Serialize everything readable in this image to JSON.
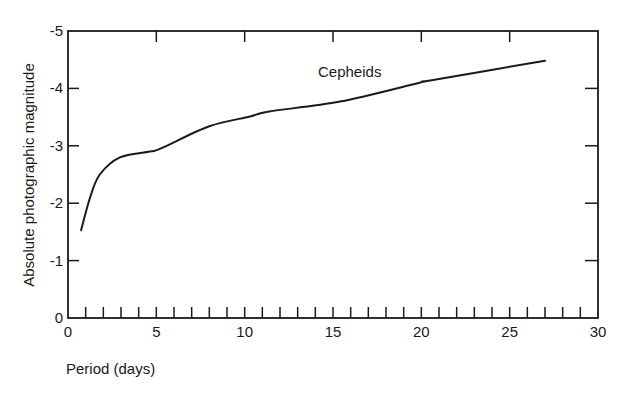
{
  "chart_data": {
    "type": "line",
    "title": "",
    "xlabel": "Period (days)",
    "ylabel": "Absolute photographic magnitude",
    "xlim": [
      0,
      30
    ],
    "ylim": [
      0,
      -5
    ],
    "y_inverted": true,
    "grid": false,
    "legend": null,
    "x_ticks": [
      0,
      5,
      10,
      15,
      20,
      25,
      30
    ],
    "x_tick_labels": [
      "0",
      "5",
      "10",
      "15",
      "20",
      "25",
      "30"
    ],
    "x_minor_tick_step": 1,
    "y_ticks": [
      0,
      -1,
      -2,
      -3,
      -4,
      -5
    ],
    "y_tick_labels": [
      "0",
      "-1",
      "-2",
      "-3",
      "-4",
      "-5"
    ],
    "annotations": [
      {
        "text": "Cepheids",
        "x": 14.2,
        "y": -4.5
      }
    ],
    "series": [
      {
        "name": "Cepheids",
        "x": [
          0.74,
          1.25,
          1.8,
          2.94,
          4.64,
          5.3,
          8.0,
          10.3,
          11.4,
          15.4,
          19.9,
          20.5,
          27.0
        ],
        "y": [
          -1.53,
          -2.1,
          -2.5,
          -2.8,
          -2.9,
          -2.96,
          -3.34,
          -3.51,
          -3.6,
          -3.77,
          -4.1,
          -4.14,
          -4.48
        ]
      }
    ]
  }
}
